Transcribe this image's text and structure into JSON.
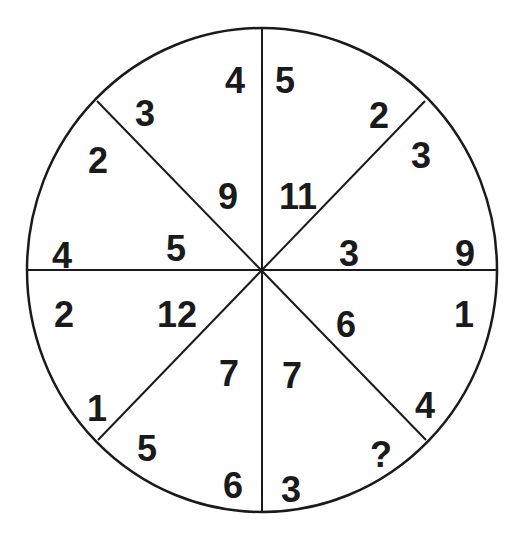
{
  "puzzle": {
    "numbers": [
      {
        "text": "4",
        "x": 235,
        "y": 80
      },
      {
        "text": "3",
        "x": 145,
        "y": 113
      },
      {
        "text": "2",
        "x": 98,
        "y": 160
      },
      {
        "text": "9",
        "x": 228,
        "y": 196
      },
      {
        "text": "4",
        "x": 62,
        "y": 255
      },
      {
        "text": "5",
        "x": 176,
        "y": 248
      },
      {
        "text": "5",
        "x": 285,
        "y": 80
      },
      {
        "text": "2",
        "x": 379,
        "y": 115
      },
      {
        "text": "3",
        "x": 421,
        "y": 155
      },
      {
        "text": "11",
        "x": 298,
        "y": 196
      },
      {
        "text": "3",
        "x": 349,
        "y": 253
      },
      {
        "text": "9",
        "x": 465,
        "y": 253
      },
      {
        "text": "2",
        "x": 64,
        "y": 314
      },
      {
        "text": "12",
        "x": 177,
        "y": 314
      },
      {
        "text": "1",
        "x": 464,
        "y": 314
      },
      {
        "text": "6",
        "x": 346,
        "y": 324
      },
      {
        "text": "7",
        "x": 229,
        "y": 373
      },
      {
        "text": "7",
        "x": 292,
        "y": 375
      },
      {
        "text": "1",
        "x": 97,
        "y": 408
      },
      {
        "text": "4",
        "x": 425,
        "y": 405
      },
      {
        "text": "5",
        "x": 147,
        "y": 448
      },
      {
        "text": "?",
        "x": 381,
        "y": 454
      },
      {
        "text": "6",
        "x": 233,
        "y": 485
      },
      {
        "text": "3",
        "x": 291,
        "y": 489
      }
    ]
  }
}
